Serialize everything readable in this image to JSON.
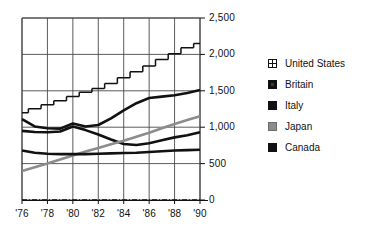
{
  "chart_data": {
    "type": "line",
    "title": "",
    "subtitle": "",
    "xlabel": "",
    "ylabel": "",
    "grid": true,
    "legend_position": "right",
    "x": [
      1976,
      1977,
      1978,
      1979,
      1980,
      1981,
      1982,
      1983,
      1984,
      1985,
      1986,
      1987,
      1988,
      1989,
      1990
    ],
    "x_tick_labels": [
      "'76",
      "'78",
      "'80",
      "'82",
      "'84",
      "'86",
      "'88",
      "'90"
    ],
    "x_tick_values": [
      1976,
      1978,
      1980,
      1982,
      1984,
      1986,
      1988,
      1990
    ],
    "xlim": [
      1976,
      1990
    ],
    "y_tick_labels": [
      "0",
      "500",
      "1,000",
      "1,500",
      "2,000",
      "2,500"
    ],
    "y_tick_values": [
      0,
      500,
      1000,
      1500,
      2000,
      2500
    ],
    "ylim": [
      0,
      2500
    ],
    "series": [
      {
        "name": "United States",
        "style": "dashed-stepped",
        "color": "#111111",
        "swatch": "pane",
        "values": [
          1200,
          1255,
          1310,
          1365,
          1420,
          1480,
          1530,
          1600,
          1680,
          1760,
          1840,
          1930,
          2010,
          2090,
          2150
        ]
      },
      {
        "name": "Britain",
        "style": "solid-thick",
        "color": "#111111",
        "swatch": "solid-inner",
        "values": [
          1110,
          1010,
          985,
          980,
          1050,
          1010,
          1030,
          1120,
          1230,
          1330,
          1400,
          1420,
          1440,
          1470,
          1510
        ]
      },
      {
        "name": "Italy",
        "style": "solid-thick",
        "color": "#111111",
        "swatch": "solid",
        "values": [
          950,
          935,
          930,
          940,
          1010,
          960,
          900,
          830,
          770,
          755,
          780,
          820,
          860,
          890,
          930
        ]
      },
      {
        "name": "Japan",
        "style": "solid-thick",
        "color": "#8c8c8c",
        "swatch": "gray",
        "values": [
          400,
          450,
          500,
          555,
          610,
          665,
          715,
          765,
          815,
          870,
          925,
          985,
          1045,
          1100,
          1150
        ]
      },
      {
        "name": "Canada",
        "style": "solid-thick",
        "color": "#111111",
        "swatch": "solid",
        "values": [
          680,
          650,
          635,
          630,
          630,
          630,
          635,
          640,
          645,
          650,
          660,
          670,
          680,
          685,
          690
        ]
      }
    ]
  },
  "legend": {
    "items": [
      {
        "label": "United States"
      },
      {
        "label": "Britain"
      },
      {
        "label": "Italy"
      },
      {
        "label": "Japan"
      },
      {
        "label": "Canada"
      }
    ]
  }
}
